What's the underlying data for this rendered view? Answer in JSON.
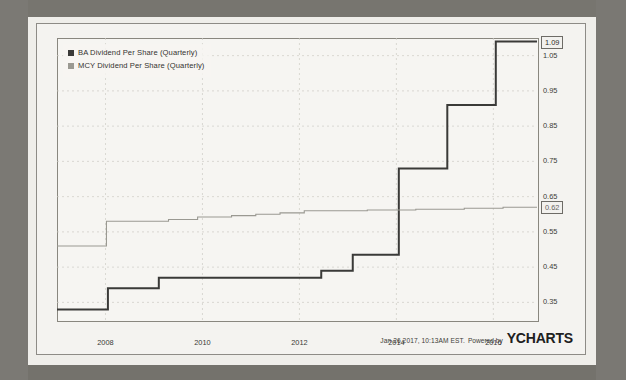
{
  "legend": {
    "items": [
      {
        "label": "BA Dividend Per Share (Quarterly)",
        "color": "#3a3a38"
      },
      {
        "label": "MCY Dividend Per Share (Quarterly)",
        "color": "#9a9992"
      }
    ]
  },
  "footer": {
    "timestamp": "Jan 26 2017, 10:13AM EST.",
    "powered_by": "Powered by",
    "brand": "YCHARTS"
  },
  "callouts": {
    "ba_last": "1.09",
    "mcy_last": "0.62"
  },
  "chart_data": {
    "type": "line",
    "title": "",
    "xlabel": "",
    "ylabel": "",
    "grid": true,
    "legend_position": "top-left",
    "y_axis_side": "right",
    "ylim": [
      0.3,
      1.1
    ],
    "yticks": [
      0.35,
      0.45,
      0.55,
      0.65,
      0.75,
      0.85,
      0.95,
      1.05
    ],
    "ytick_labels": [
      "0.35",
      "0.45",
      "0.55",
      "0.65",
      "0.75",
      "0.85",
      "0.95",
      "1.05"
    ],
    "xlim": [
      2007.0,
      2016.9
    ],
    "xticks": [
      2008,
      2010,
      2012,
      2014,
      2016
    ],
    "xtick_labels": [
      "2008",
      "2010",
      "2012",
      "2014",
      "2016"
    ],
    "series": [
      {
        "name": "BA Dividend Per Share (Quarterly)",
        "color": "#3a3a38",
        "width": 2.0,
        "style": "step",
        "points": [
          [
            2007.0,
            0.33
          ],
          [
            2008.05,
            0.33
          ],
          [
            2008.05,
            0.39
          ],
          [
            2009.1,
            0.39
          ],
          [
            2009.1,
            0.42
          ],
          [
            2012.45,
            0.42
          ],
          [
            2012.45,
            0.44
          ],
          [
            2013.1,
            0.44
          ],
          [
            2013.1,
            0.485
          ],
          [
            2014.05,
            0.485
          ],
          [
            2014.05,
            0.73
          ],
          [
            2015.05,
            0.73
          ],
          [
            2015.05,
            0.91
          ],
          [
            2016.05,
            0.91
          ],
          [
            2016.05,
            1.09
          ],
          [
            2016.9,
            1.09
          ]
        ]
      },
      {
        "name": "MCY Dividend Per Share (Quarterly)",
        "color": "#9a9992",
        "width": 1.1,
        "style": "step",
        "points": [
          [
            2007.0,
            0.51
          ],
          [
            2008.02,
            0.51
          ],
          [
            2008.02,
            0.58
          ],
          [
            2009.3,
            0.58
          ],
          [
            2009.3,
            0.585
          ],
          [
            2009.9,
            0.585
          ],
          [
            2009.9,
            0.592
          ],
          [
            2010.6,
            0.592
          ],
          [
            2010.6,
            0.596
          ],
          [
            2011.1,
            0.596
          ],
          [
            2011.1,
            0.6
          ],
          [
            2011.6,
            0.6
          ],
          [
            2011.6,
            0.604
          ],
          [
            2012.1,
            0.604
          ],
          [
            2012.1,
            0.61
          ],
          [
            2013.4,
            0.61
          ],
          [
            2013.4,
            0.612
          ],
          [
            2014.4,
            0.612
          ],
          [
            2014.4,
            0.614
          ],
          [
            2015.4,
            0.614
          ],
          [
            2015.4,
            0.617
          ],
          [
            2016.2,
            0.617
          ],
          [
            2016.2,
            0.62
          ],
          [
            2016.9,
            0.62
          ]
        ]
      }
    ]
  }
}
